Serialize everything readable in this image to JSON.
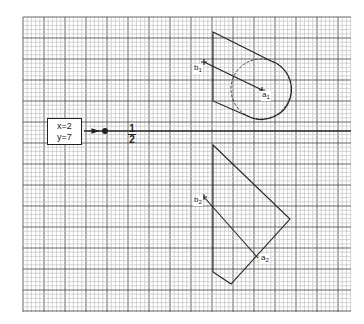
{
  "grid": {
    "left": 23,
    "top": 17,
    "right": 351,
    "bottom": 312,
    "minor_step": 4.2,
    "major_every": 5,
    "minor_color": "#b8b8b8",
    "major_color": "#555555"
  },
  "axis": {
    "y": 131,
    "x_start": 84,
    "x_end": 351
  },
  "coord_box": {
    "x_line": "x=2",
    "y_line": "y=7"
  },
  "fraction": {
    "numerator": "1",
    "denominator": "2"
  },
  "labels": {
    "b1": {
      "base": "b",
      "sub": "1"
    },
    "a1": {
      "base": "a",
      "sub": "1"
    },
    "b2": {
      "base": "b",
      "sub": "2"
    },
    "a2": {
      "base": "a",
      "sub": "2"
    }
  },
  "top_view": {
    "polygon": [
      [
        213,
        32
      ],
      [
        213,
        101
      ]
    ],
    "top_edge": [
      [
        213,
        32
      ],
      [
        271,
        61
      ]
    ],
    "bottom_edge": [
      [
        213,
        101
      ],
      [
        252,
        118
      ]
    ],
    "circle": {
      "cx": 261,
      "cy": 89,
      "r": 30
    },
    "line_b1_a1": [
      [
        204,
        62
      ],
      [
        262,
        90
      ]
    ]
  },
  "front_view": {
    "path": [
      [
        213,
        145
      ],
      [
        290,
        219
      ],
      [
        231,
        284
      ],
      [
        213,
        272
      ],
      [
        213,
        145
      ]
    ],
    "line_b2_a2": [
      [
        204,
        197
      ],
      [
        258,
        258
      ]
    ]
  }
}
